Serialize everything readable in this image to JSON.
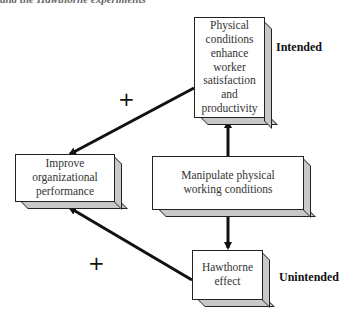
{
  "caption": "and the Hawthorne experiments",
  "boxes": {
    "physical_conditions": "Physical conditions enhance worker satisfaction and productivity",
    "improve_performance": "Improve organizational performance",
    "manipulate": "Manipulate physical working conditions",
    "hawthorne": "Hawthorne effect"
  },
  "labels": {
    "intended": "Intended",
    "unintended": "Unintended",
    "plus_upper": "+",
    "plus_lower": "+"
  },
  "colors": {
    "line": "#111111",
    "box_side": "#c8c8c8"
  }
}
